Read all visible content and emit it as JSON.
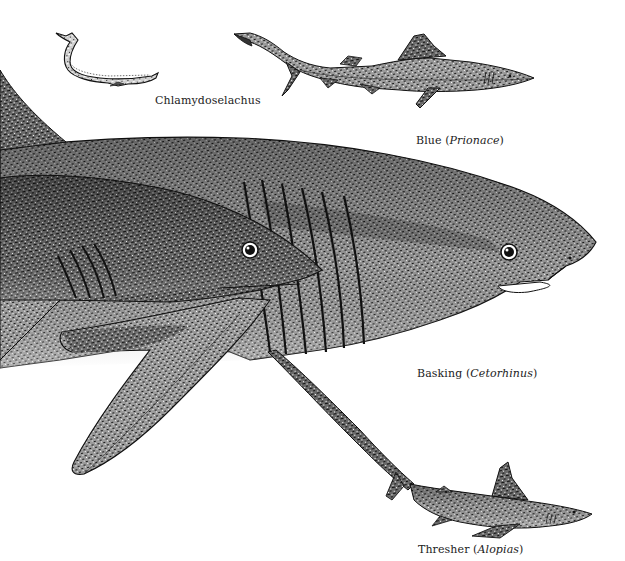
{
  "plate": {
    "background": "#ffffff",
    "ink": "#111111",
    "labels": {
      "chlamydoselachus": {
        "common": "Chlamydoselachus",
        "genus": ""
      },
      "blue": {
        "common": "Blue (",
        "genus": "Prionace",
        "close": ")"
      },
      "basking": {
        "common": "Basking (",
        "genus": "Cetorhinus",
        "close": ")"
      },
      "thresher": {
        "common": "Thresher (",
        "genus": "Alopias",
        "close": ")"
      }
    },
    "figures": [
      {
        "name": "Chlamydoselachus",
        "kind": "frilled shark, eel-like"
      },
      {
        "name": "Blue (Prionace)",
        "kind": "slender shark"
      },
      {
        "name": "Basking (Cetorhinus)",
        "kind": "large shark, foreground, long gill slits"
      },
      {
        "name": "Thresher (Alopias)",
        "kind": "shark with very long upper tail lobe"
      }
    ]
  }
}
